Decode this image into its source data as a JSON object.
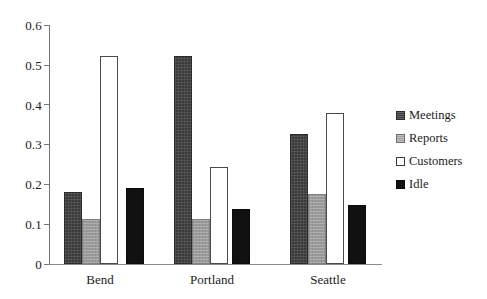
{
  "chart_data": {
    "type": "bar",
    "title": "",
    "subtitle": "",
    "xlabel": "",
    "ylabel": "",
    "categories": [
      "Bend",
      "Portland",
      "Seattle"
    ],
    "series": [
      {
        "name": "Meetings",
        "values": [
          0.181,
          0.523,
          0.326
        ],
        "color": "#3b3b3b",
        "swatch": "dark-gray-hatch"
      },
      {
        "name": "Reports",
        "values": [
          0.112,
          0.114,
          0.177
        ],
        "color": "#9b9b9b",
        "swatch": "light-gray-hatch"
      },
      {
        "name": "Customers",
        "values": [
          0.521,
          0.244,
          0.378
        ],
        "color": "#ffffff",
        "swatch": "white-outline"
      },
      {
        "name": "Idle",
        "values": [
          0.192,
          0.137,
          0.148
        ],
        "color": "#111111",
        "swatch": "solid-black"
      }
    ],
    "ylim": [
      0,
      0.6
    ],
    "ytick_values": [
      0,
      0.1,
      0.2,
      0.3,
      0.4,
      0.5,
      0.6
    ],
    "ytick_labels": [
      "0",
      "0.1",
      "0.2",
      "0.3",
      "0.4",
      "0.5",
      "0.6"
    ],
    "grid": false,
    "legend_position": "right",
    "legend_entries": [
      "Meetings",
      "Reports",
      "Customers",
      "Idle"
    ]
  }
}
